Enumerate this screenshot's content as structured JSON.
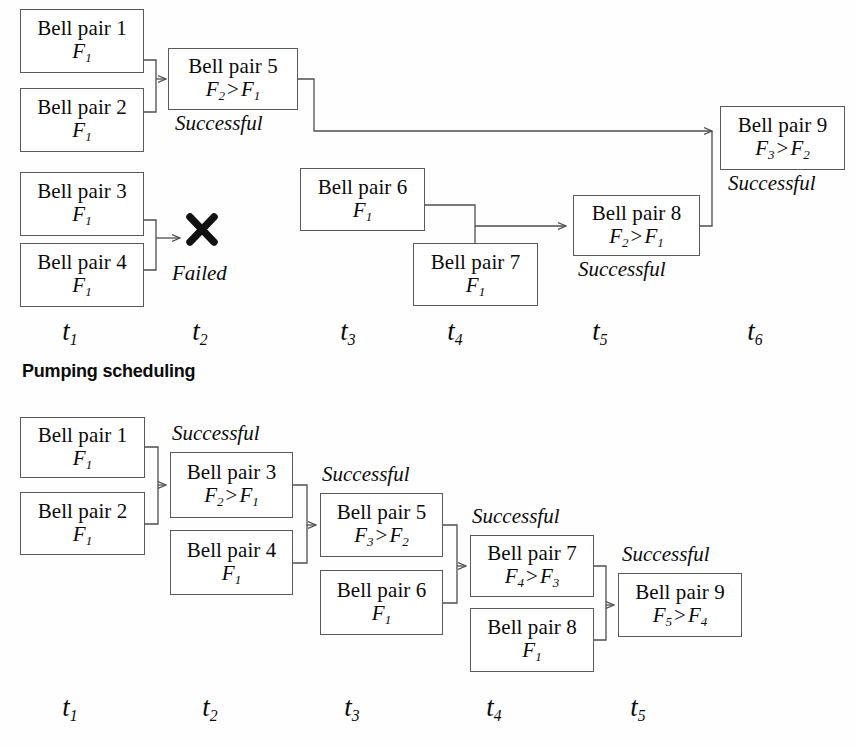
{
  "sections": [
    {
      "id": "swapping",
      "title": "",
      "nodes": [
        {
          "name": "bp1",
          "label": "Bell pair 1",
          "fidelity": "F1",
          "x": 20,
          "y": 9,
          "w": 124,
          "h": 64
        },
        {
          "name": "bp2",
          "label": "Bell pair 2",
          "fidelity": "F1",
          "x": 20,
          "y": 88,
          "w": 124,
          "h": 64
        },
        {
          "name": "bp3",
          "label": "Bell pair 3",
          "fidelity": "F1",
          "x": 20,
          "y": 172,
          "w": 124,
          "h": 64
        },
        {
          "name": "bp4",
          "label": "Bell pair 4",
          "fidelity": "F1",
          "x": 20,
          "y": 243,
          "w": 124,
          "h": 64
        },
        {
          "name": "bp5",
          "label": "Bell pair 5",
          "fidelity": "F2 > F1",
          "x": 168,
          "y": 48,
          "w": 130,
          "h": 62
        },
        {
          "name": "bp6",
          "label": "Bell pair 6",
          "fidelity": "F1",
          "x": 300,
          "y": 168,
          "w": 125,
          "h": 63
        },
        {
          "name": "bp7",
          "label": "Bell pair 7",
          "fidelity": "F1",
          "x": 413,
          "y": 243,
          "w": 125,
          "h": 63
        },
        {
          "name": "bp8",
          "label": "Bell pair 8",
          "fidelity": "F2 > F1",
          "x": 573,
          "y": 195,
          "w": 127,
          "h": 61
        },
        {
          "name": "bp9",
          "label": "Bell pair 9",
          "fidelity": "F3 > F2",
          "x": 720,
          "y": 106,
          "w": 125,
          "h": 64
        }
      ],
      "annotations": [
        {
          "name": "status-bp5",
          "text": "Successful",
          "x": 175,
          "y": 111
        },
        {
          "name": "status-failed",
          "text": "Failed",
          "x": 172,
          "y": 261
        },
        {
          "name": "status-bp8",
          "text": "Successful",
          "x": 578,
          "y": 257
        },
        {
          "name": "status-bp9",
          "text": "Successful",
          "x": 728,
          "y": 171
        }
      ],
      "fail_mark": {
        "name": "failed-cross-icon",
        "x": 185,
        "y": 213
      },
      "time_labels": [
        {
          "text": "t1",
          "x": 70
        },
        {
          "text": "t2",
          "x": 200
        },
        {
          "text": "t3",
          "x": 348
        },
        {
          "text": "t4",
          "x": 455
        },
        {
          "text": "t5",
          "x": 600
        },
        {
          "text": "t6",
          "x": 755
        }
      ],
      "time_label_y": 316
    },
    {
      "id": "pumping",
      "title": "Pumping scheduling",
      "title_x": 22,
      "title_y": 361,
      "nodes": [
        {
          "name": "bp1",
          "label": "Bell pair 1",
          "fidelity": "F1",
          "x": 20,
          "y": 417,
          "w": 125,
          "h": 61
        },
        {
          "name": "bp2",
          "label": "Bell pair 2",
          "fidelity": "F1",
          "x": 20,
          "y": 492,
          "w": 125,
          "h": 63
        },
        {
          "name": "bp3",
          "label": "Bell pair 3",
          "fidelity": "F2 > F1",
          "x": 170,
          "y": 452,
          "w": 123,
          "h": 66
        },
        {
          "name": "bp4",
          "label": "Bell pair 4",
          "fidelity": "F1",
          "x": 170,
          "y": 530,
          "w": 123,
          "h": 65
        },
        {
          "name": "bp5",
          "label": "Bell pair 5",
          "fidelity": "F3 > F2",
          "x": 320,
          "y": 493,
          "w": 123,
          "h": 64
        },
        {
          "name": "bp6",
          "label": "Bell pair 6",
          "fidelity": "F1",
          "x": 320,
          "y": 570,
          "w": 123,
          "h": 65
        },
        {
          "name": "bp7",
          "label": "Bell pair 7",
          "fidelity": "F4 > F3",
          "x": 470,
          "y": 535,
          "w": 124,
          "h": 62
        },
        {
          "name": "bp8",
          "label": "Bell pair 8",
          "fidelity": "F1",
          "x": 470,
          "y": 608,
          "w": 124,
          "h": 64
        },
        {
          "name": "bp9",
          "label": "Bell pair 9",
          "fidelity": "F5 > F4",
          "x": 618,
          "y": 573,
          "w": 124,
          "h": 64
        }
      ],
      "annotations": [
        {
          "name": "status-bp3",
          "text": "Successful",
          "x": 172,
          "y": 421
        },
        {
          "name": "status-bp5",
          "text": "Successful",
          "x": 322,
          "y": 462
        },
        {
          "name": "status-bp7",
          "text": "Successful",
          "x": 472,
          "y": 504
        },
        {
          "name": "status-bp9",
          "text": "Successful",
          "x": 622,
          "y": 542
        }
      ],
      "time_labels": [
        {
          "text": "t1",
          "x": 70
        },
        {
          "text": "t2",
          "x": 210
        },
        {
          "text": "t3",
          "x": 352
        },
        {
          "text": "t4",
          "x": 494
        },
        {
          "text": "t5",
          "x": 638
        }
      ],
      "time_label_y": 692
    }
  ],
  "colors": {
    "box_border": "#5a5a5a",
    "wire": "#4d4d4d",
    "text": "#0b0b0b",
    "background": "#fefefe"
  }
}
